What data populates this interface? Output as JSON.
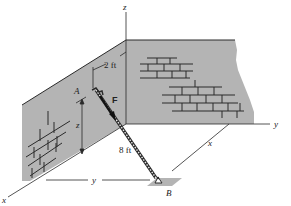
{
  "diagram": {
    "type": "3D statics diagram - ladder against wall",
    "axes": {
      "x_label": "x",
      "y_label": "y",
      "z_label": "z"
    },
    "points": {
      "A": "A",
      "B": "B"
    },
    "force_label": "F",
    "dimensions": {
      "offset": "2 ft",
      "ladder_length": "8 ft",
      "height": "z",
      "horizontal_y": "y",
      "horizontal_x": "x"
    },
    "colors": {
      "wall_fill": "#b4b4b4",
      "line": "#2a2a2a",
      "background": "#ffffff"
    }
  }
}
